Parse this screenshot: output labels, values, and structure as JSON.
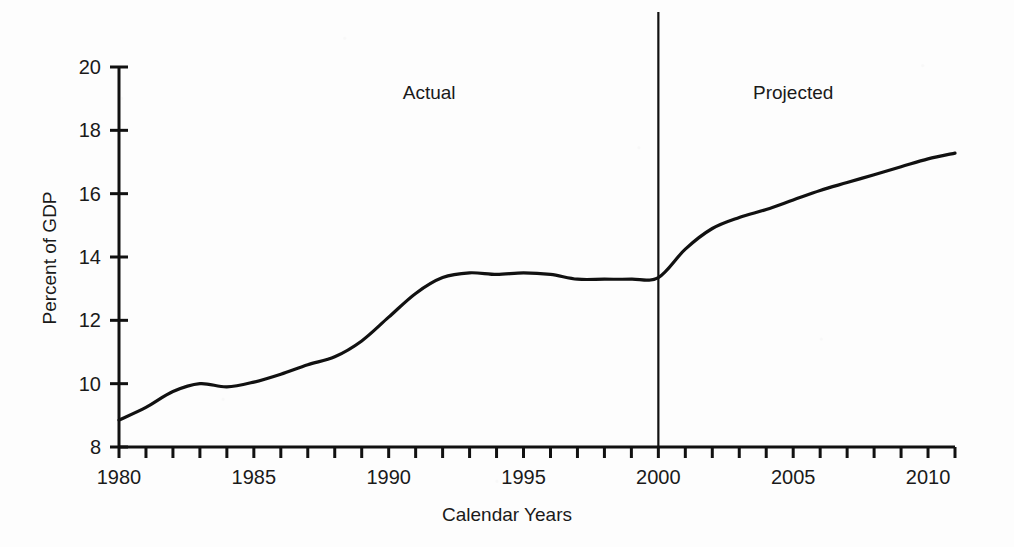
{
  "chart_data": {
    "type": "line",
    "title": "",
    "xlabel": "Calendar Years",
    "ylabel": "Percent of GDP",
    "xlim": [
      1980,
      2011
    ],
    "ylim": [
      8,
      20
    ],
    "xticks": [
      1980,
      1981,
      1982,
      1983,
      1984,
      1985,
      1986,
      1987,
      1988,
      1989,
      1990,
      1991,
      1992,
      1993,
      1994,
      1995,
      1996,
      1997,
      1998,
      1999,
      2000,
      2001,
      2002,
      2003,
      2004,
      2005,
      2006,
      2007,
      2008,
      2009,
      2010,
      2011
    ],
    "xtick_labels": [
      "1980",
      "1985",
      "1990",
      "1995",
      "2000",
      "2005",
      "2010"
    ],
    "xtick_label_values": [
      1980,
      1985,
      1990,
      1995,
      2000,
      2005,
      2010
    ],
    "yticks": [
      8,
      10,
      12,
      14,
      16,
      18,
      20
    ],
    "ytick_labels": [
      "8",
      "10",
      "12",
      "14",
      "16",
      "18",
      "20"
    ],
    "grid": false,
    "legend": "none",
    "series": [
      {
        "name": "Percent of GDP",
        "x": [
          1980,
          1981,
          1982,
          1983,
          1984,
          1985,
          1986,
          1987,
          1988,
          1989,
          1990,
          1991,
          1992,
          1993,
          1994,
          1995,
          1996,
          1997,
          1998,
          1999,
          2000,
          2001,
          2002,
          2003,
          2004,
          2005,
          2006,
          2007,
          2008,
          2009,
          2010,
          2011
        ],
        "values": [
          8.85,
          9.25,
          9.75,
          10.0,
          9.9,
          10.05,
          10.3,
          10.6,
          10.85,
          11.35,
          12.1,
          12.85,
          13.35,
          13.5,
          13.45,
          13.5,
          13.45,
          13.3,
          13.3,
          13.3,
          13.35,
          14.25,
          14.9,
          15.25,
          15.5,
          15.8,
          16.1,
          16.35,
          16.6,
          16.85,
          17.1,
          17.28
        ]
      }
    ],
    "annotations": [
      {
        "text": "Actual",
        "x_value": 1991.5,
        "y_value": 19.0
      },
      {
        "text": "Projected",
        "x_value": 2005.0,
        "y_value": 19.0
      }
    ],
    "divider": {
      "x_value": 2000,
      "label": "actual-projected-divider"
    }
  },
  "colors": {
    "line": "#111111",
    "axis": "#111111",
    "background": "#fdfdfd",
    "text": "#1a1a1a"
  }
}
